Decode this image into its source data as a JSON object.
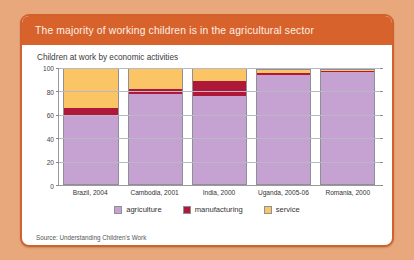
{
  "card": {
    "title": "The majority of working children is in the agricultural sector",
    "subtitle": "Children at work by economic activities",
    "source": "Source: Understanding Children's Work"
  },
  "colors": {
    "frame": "#d1622e",
    "header": "#d8622c",
    "page_background": "#e9a87b",
    "agriculture": "#c6a2d2",
    "manufacturing": "#b0183a",
    "service": "#fbc565"
  },
  "chart_data": {
    "type": "bar",
    "stacked": true,
    "title": "Children at work by economic activities",
    "xlabel": "",
    "ylabel": "",
    "ylim": [
      0,
      100
    ],
    "yticks": [
      0,
      20,
      40,
      60,
      80,
      100
    ],
    "grid": true,
    "legend_position": "bottom",
    "categories": [
      "Brazil, 2004",
      "Cambodia, 2001",
      "India, 2000",
      "Uganda, 2005-06",
      "Romania, 2000"
    ],
    "series": [
      {
        "name": "agriculture",
        "color": "#c6a2d2",
        "values": [
          60,
          78,
          76,
          94,
          97
        ]
      },
      {
        "name": "manufacturing",
        "color": "#b0183a",
        "values": [
          6,
          4,
          13,
          2,
          0.5
        ]
      },
      {
        "name": "service",
        "color": "#fbc565",
        "values": [
          34,
          18,
          11,
          3,
          2
        ]
      }
    ]
  }
}
